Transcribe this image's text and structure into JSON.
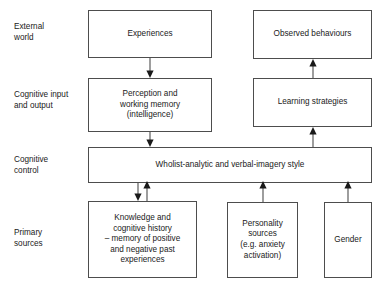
{
  "diagram": {
    "line_color": "#4d4d4d",
    "text_color": "#1a1a1a",
    "background": "#ffffff",
    "row_labels": [
      {
        "id": "external-world",
        "text": "External\nworld"
      },
      {
        "id": "cognitive-input-and-output",
        "text": "Cognitive input\nand output"
      },
      {
        "id": "cognitive-control",
        "text": "Cognitive\ncontrol"
      },
      {
        "id": "primary-sources",
        "text": "Primary\nsources"
      }
    ],
    "boxes": [
      {
        "id": "experiences",
        "text": "Experiences"
      },
      {
        "id": "observed-behaviours",
        "text": "Observed behaviours"
      },
      {
        "id": "perception-and-working-memory",
        "text": "Perception and\nworking memory\n(intelligence)"
      },
      {
        "id": "learning-strategies",
        "text": "Learning strategies"
      },
      {
        "id": "wholist-analytic-and-verbal-imagery-style",
        "text": "Wholist-analytic and verbal-imagery style"
      },
      {
        "id": "knowledge-and-cognitive-history",
        "text": "Knowledge and\ncognitive history\n– memory of positive\nand negative past\nexperiences"
      },
      {
        "id": "personality-sources",
        "text": "Personality\nsources\n(e.g. anxiety\nactivation)"
      },
      {
        "id": "gender",
        "text": "Gender"
      }
    ],
    "arrows": [
      {
        "id": "experiences-to-perception",
        "direction": "down"
      },
      {
        "id": "learning-strategies-to-observed-behaviours",
        "direction": "up"
      },
      {
        "id": "perception-to-style",
        "direction": "down"
      },
      {
        "id": "style-to-learning-strategies",
        "direction": "up"
      },
      {
        "id": "style-to-knowledge",
        "direction": "down"
      },
      {
        "id": "knowledge-to-style",
        "direction": "up"
      },
      {
        "id": "personality-to-style",
        "direction": "up"
      },
      {
        "id": "gender-to-style",
        "direction": "up"
      }
    ]
  }
}
